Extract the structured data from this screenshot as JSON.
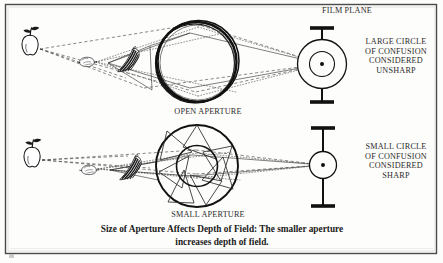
{
  "figure": {
    "name": "depth-of-field-aperture-diagram",
    "background_color": "#fdfdfb",
    "ink_color": "#1a1a1a",
    "border_color": "#4a4a4a",
    "labels": {
      "film_plane": "FILM PLANE",
      "large_circle_of_confusion": "LARGE CIRCLE\nOF CONFUSION\nCONSIDERED\nUNSHARP",
      "small_circle_of_confusion": "SMALL CIRCLE\nOF CONFUSION\nCONSIDERED\nSHARP",
      "open_aperture": "OPEN APERTURE",
      "small_aperture": "SMALL APERTURE"
    },
    "caption": {
      "line1": "Size of Aperture Affects Depth of Field:  The smaller aperture",
      "line2": "increases depth of field."
    },
    "subjects": [
      {
        "name": "apple",
        "row": "top",
        "distance": "far"
      },
      {
        "name": "lemon",
        "row": "top",
        "distance": "middle"
      },
      {
        "name": "bananas",
        "row": "top",
        "distance": "near"
      },
      {
        "name": "apple",
        "row": "bottom",
        "distance": "far"
      },
      {
        "name": "lemon",
        "row": "bottom",
        "distance": "middle"
      },
      {
        "name": "bananas",
        "row": "bottom",
        "distance": "near"
      }
    ],
    "ray_styles": {
      "apple_rays": "dashed",
      "lemon_rays": "dotted",
      "banana_rays": "solid"
    },
    "rows": [
      {
        "id": "open-aperture-row",
        "aperture": "OPEN APERTURE",
        "aperture_opening": "wide",
        "film_plane_spot": "large",
        "sharpness": "UNSHARP"
      },
      {
        "id": "small-aperture-row",
        "aperture": "SMALL APERTURE",
        "aperture_opening": "narrow",
        "film_plane_spot": "small",
        "sharpness": "SHARP"
      }
    ]
  }
}
